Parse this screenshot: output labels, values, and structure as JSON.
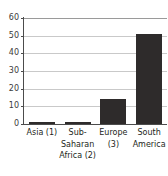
{
  "chart_data": {
    "type": "bar",
    "title": "",
    "subtitle": "",
    "xlabel": "",
    "ylabel": "",
    "categories": [
      "Asia (1)",
      "Sub-Saharan Africa (2)",
      "Europe (3)",
      "South America"
    ],
    "category_lines": [
      [
        "Asia (1)"
      ],
      [
        "Sub-",
        "Saharan",
        "Africa (2)"
      ],
      [
        "Europe",
        "(3)"
      ],
      [
        "South",
        "America"
      ]
    ],
    "values": [
      1,
      1,
      14,
      51
    ],
    "ylim": [
      0,
      60
    ],
    "yticks": [
      0,
      10,
      20,
      30,
      40,
      50,
      60
    ],
    "ytick_labels": [
      "0",
      "10",
      "20",
      "30",
      "40",
      "50",
      "60"
    ],
    "grid": "horizontal",
    "legend": "none",
    "colors": {
      "bar": "#2e2b2b",
      "axis": "#4c4c4c",
      "gridline": "#c9c9c9",
      "top_gridline": "#9a9a9a",
      "text": "#231f20",
      "background": "#ffffff"
    }
  }
}
